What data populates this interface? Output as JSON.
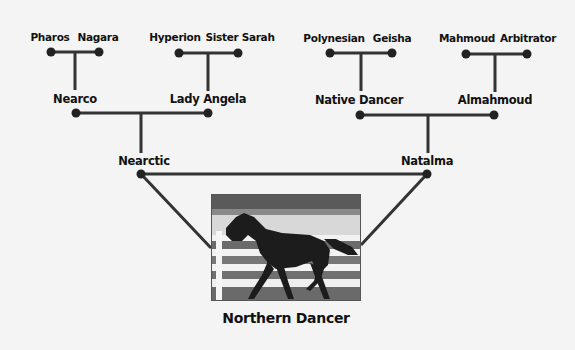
{
  "subject": {
    "name": "Northern Dancer",
    "photo": "horse-photo (black and white, horse trotting past white fence)"
  },
  "parents": {
    "sire": "Nearctic",
    "dam": "Natalma"
  },
  "grandparents": {
    "sire_sire": "Nearco",
    "sire_dam": "Lady Angela",
    "dam_sire": "Native Dancer",
    "dam_dam": "Almahmoud"
  },
  "great_grandparents": {
    "nearco_sire": "Pharos",
    "nearco_dam": "Nagara",
    "lady_angela_sire": "Hyperion",
    "lady_angela_dam": "Sister Sarah",
    "native_dancer_sire": "Polynesian",
    "native_dancer_dam": "Geisha",
    "almahmoud_sire": "Mahmoud",
    "almahmoud_dam": "Arbitrator"
  },
  "colors": {
    "line": "#333333",
    "node": "#222222",
    "background": "#f4f4f4",
    "text": "#111111"
  }
}
